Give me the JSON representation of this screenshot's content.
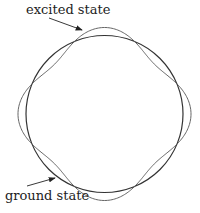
{
  "labels": {
    "excited": "excited state",
    "ground": "ground state"
  },
  "diagram": {
    "circle": {
      "cx": 104.5,
      "cy": 114,
      "r": 78.5,
      "color": "#333333"
    },
    "wavy": {
      "cx": 104.5,
      "cy": 114,
      "r": 78.5,
      "amplitude": 8,
      "lobes": 4,
      "color": "#555555"
    }
  }
}
